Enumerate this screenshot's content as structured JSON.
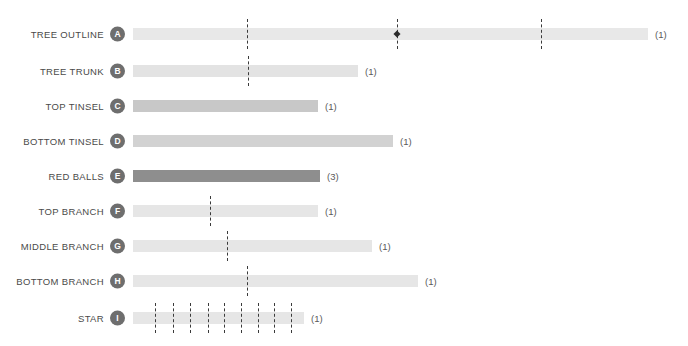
{
  "chart_data": {
    "type": "bar",
    "title": "",
    "xlabel": "",
    "ylabel": "",
    "orientation": "horizontal",
    "grid": false,
    "legend": "none",
    "axis_start_px": 133,
    "categories": [
      "TREE OUTLINE",
      "TREE TRUNK",
      "TOP TINSEL",
      "BOTTOM TINSEL",
      "RED BALLS",
      "TOP BRANCH",
      "MIDDLE BRANCH",
      "BOTTOM BRANCH",
      "STAR"
    ],
    "values": [
      515,
      225,
      185,
      260,
      187,
      185,
      239,
      285,
      171
    ],
    "counts": [
      "(1)",
      "(1)",
      "(1)",
      "(1)",
      "(3)",
      "(1)",
      "(1)",
      "(1)",
      "(1)"
    ]
  },
  "rows": [
    {
      "label": "TREE OUTLINE",
      "badge": "A",
      "count": "(1)",
      "bar_start": 133,
      "bar_end": 648,
      "color": "#e8e8e8",
      "top": 15,
      "dashes": [
        247,
        397,
        541
      ],
      "markers": [
        397
      ]
    },
    {
      "label": "TREE TRUNK",
      "badge": "B",
      "count": "(1)",
      "bar_start": 133,
      "bar_end": 358,
      "color": "#e3e3e3",
      "top": 52,
      "dashes": [
        248
      ],
      "markers": []
    },
    {
      "label": "TOP TINSEL",
      "badge": "C",
      "count": "(1)",
      "bar_start": 133,
      "bar_end": 318,
      "color": "#c8c8c8",
      "top": 87,
      "dashes": [],
      "markers": []
    },
    {
      "label": "BOTTOM TINSEL",
      "badge": "D",
      "count": "(1)",
      "bar_start": 133,
      "bar_end": 393,
      "color": "#d2d2d2",
      "top": 122,
      "dashes": [],
      "markers": []
    },
    {
      "label": "RED BALLS",
      "badge": "E",
      "count": "(3)",
      "bar_start": 133,
      "bar_end": 320,
      "color": "#8e8e8e",
      "top": 157,
      "dashes": [],
      "markers": []
    },
    {
      "label": "TOP BRANCH",
      "badge": "F",
      "count": "(1)",
      "bar_start": 133,
      "bar_end": 318,
      "color": "#e6e6e6",
      "top": 192,
      "dashes": [
        210
      ],
      "markers": []
    },
    {
      "label": "MIDDLE BRANCH",
      "badge": "G",
      "count": "(1)",
      "bar_start": 133,
      "bar_end": 372,
      "color": "#e6e6e6",
      "top": 227,
      "dashes": [
        227
      ],
      "markers": []
    },
    {
      "label": "BOTTOM BRANCH",
      "badge": "H",
      "count": "(1)",
      "bar_start": 133,
      "bar_end": 418,
      "color": "#e6e6e6",
      "top": 262,
      "dashes": [
        247
      ],
      "markers": []
    },
    {
      "label": "STAR",
      "badge": "I",
      "count": "(1)",
      "bar_start": 133,
      "bar_end": 304,
      "color": "#e6e6e6",
      "top": 299,
      "dashes": [
        155,
        173,
        190,
        208,
        224,
        241,
        258,
        274,
        291
      ],
      "markers": []
    }
  ],
  "colors": {
    "background": "#ffffff",
    "badge_fill": "#6e6e6e",
    "badge_text": "#ffffff",
    "label_text": "#4a4a4a",
    "count_text": "#5a5a5a",
    "dash_line": "#3a3a3a",
    "marker": "#2b2b2b"
  }
}
